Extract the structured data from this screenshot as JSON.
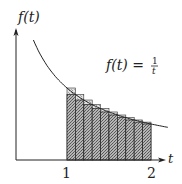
{
  "diagram": {
    "y_axis_label": "f(t)",
    "x_axis_label": "t",
    "function_label": "f(t) = ",
    "fraction_numerator": "1",
    "fraction_denominator": "t",
    "tick_labels": [
      "1",
      "2"
    ]
  },
  "chart_data": {
    "type": "bar",
    "title": "",
    "function": "f(t) = 1/t",
    "xlabel": "t",
    "ylabel": "f(t)",
    "interval": [
      1,
      2
    ],
    "n_rectangles": 10,
    "x_left_edges": [
      1.0,
      1.1,
      1.2,
      1.3,
      1.4,
      1.5,
      1.6,
      1.7,
      1.8,
      1.9
    ],
    "series": [
      {
        "name": "upper (left endpoint)",
        "values": [
          1.0,
          0.909,
          0.833,
          0.769,
          0.714,
          0.667,
          0.625,
          0.588,
          0.556,
          0.526
        ]
      },
      {
        "name": "lower (right endpoint)",
        "values": [
          0.909,
          0.833,
          0.769,
          0.714,
          0.667,
          0.625,
          0.588,
          0.556,
          0.526,
          0.5
        ]
      }
    ],
    "colors": {
      "lower_fill": "#8a8a8a",
      "upper_fill": "#c8c8c8",
      "line": "#222222"
    }
  }
}
